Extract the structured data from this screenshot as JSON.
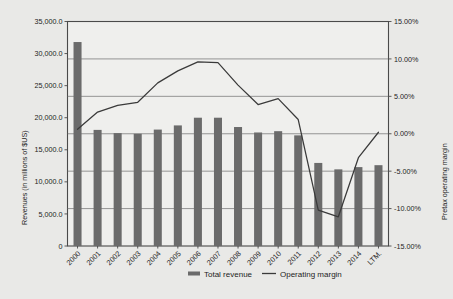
{
  "chart_data": {
    "type": "bar",
    "title": "",
    "subtitle": "",
    "xlabel": "",
    "ylabel": "Revenues (in millions of $US)",
    "y2label": "Pretax operating margin",
    "grid": true,
    "legend_position": "bottom",
    "categories": [
      "2000",
      "2001",
      "2002",
      "2003",
      "2004",
      "2005",
      "2006",
      "2007",
      "2008",
      "2009",
      "2010",
      "2011",
      "2012",
      "2013",
      "2014",
      "LTM."
    ],
    "ylim": [
      0,
      35000
    ],
    "y2lim": [
      -15,
      15
    ],
    "yticks": [
      0,
      5000,
      10000,
      15000,
      20000,
      25000,
      30000,
      35000
    ],
    "ytick_labels": [
      "0",
      "5,000.0",
      "10,000.0",
      "15,000.0",
      "20,000.0",
      "25,000.0",
      "30,000.0",
      "35,000.0"
    ],
    "y2ticks": [
      -15,
      -10,
      -5,
      0,
      5,
      10,
      15
    ],
    "y2tick_labels": [
      "-15.00%",
      "-10.00%",
      "-5.00%",
      "0.00%",
      "5.00%",
      "10.00%",
      "15.00%"
    ],
    "series": [
      {
        "name": "Total revenue",
        "type": "bar",
        "axis": "left",
        "color": "#6b6b6b",
        "values": [
          31800,
          18100,
          17600,
          17500,
          18150,
          18800,
          20000,
          20000,
          18550,
          17700,
          17900,
          17250,
          12950,
          11950,
          12300,
          12600
        ]
      },
      {
        "name": "Operating margin",
        "type": "line",
        "axis": "right",
        "color": "#3a3a3a",
        "values": [
          0.6,
          2.9,
          3.8,
          4.2,
          6.8,
          8.4,
          9.6,
          9.5,
          6.5,
          3.9,
          4.7,
          1.9,
          -10.2,
          -11.1,
          -3.2,
          0.2
        ]
      }
    ],
    "legend": [
      {
        "label": "Total revenue",
        "marker": "bar",
        "color": "#6b6b6b"
      },
      {
        "label": "Operating margin",
        "marker": "line",
        "color": "#3a3a3a"
      }
    ]
  }
}
